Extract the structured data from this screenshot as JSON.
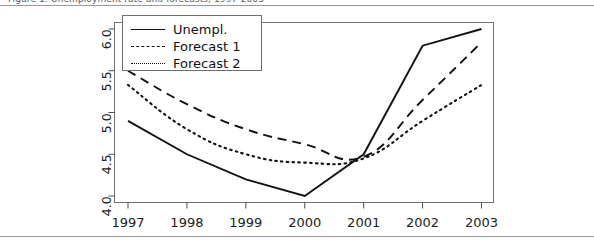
{
  "page": {
    "cropped_header_text": "Figure 1: Unemployment rate and forecasts, 1997-2003"
  },
  "chart_data": {
    "type": "line",
    "title": "",
    "xlabel": "",
    "ylabel": "",
    "categories": [
      "1997",
      "1998",
      "1999",
      "2000",
      "2001",
      "2002",
      "2003"
    ],
    "x": [
      1997,
      1998,
      1999,
      2000,
      2001,
      2002,
      2003
    ],
    "xlim": [
      1997,
      2003
    ],
    "ylim": [
      4.0,
      6.0
    ],
    "yticks": [
      "4.0",
      "4.5",
      "5.0",
      "5.5",
      "6.0"
    ],
    "ytick_values": [
      4.0,
      4.5,
      5.0,
      5.5,
      6.0
    ],
    "grid": false,
    "legend_position": "top-left",
    "series": [
      {
        "name": "Unempl.",
        "style": "solid",
        "color": "#111111",
        "values": [
          4.9,
          4.5,
          4.2,
          4.0,
          4.5,
          5.8,
          6.0
        ]
      },
      {
        "name": "Forecast 1",
        "style": "dashed",
        "color": "#111111",
        "values": [
          5.5,
          5.1,
          4.8,
          4.62,
          4.47,
          5.15,
          5.84
        ]
      },
      {
        "name": "Forecast 2",
        "style": "dotted",
        "color": "#111111",
        "values": [
          5.33,
          4.8,
          4.5,
          4.4,
          4.45,
          4.9,
          5.33
        ]
      }
    ],
    "legend": [
      "Unempl.",
      "Forecast 1",
      "Forecast 2"
    ],
    "axis_color": "#4d4d51",
    "frame": true
  }
}
